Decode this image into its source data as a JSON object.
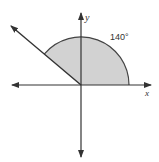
{
  "diagram": {
    "type": "angle-in-standard-position",
    "angle_label": "140°",
    "angle_degrees": 140,
    "x_axis_label": "x",
    "y_axis_label": "y",
    "colors": {
      "line": "#333333",
      "sector_fill": "#d2d2d2",
      "sector_stroke": "#444444"
    }
  }
}
